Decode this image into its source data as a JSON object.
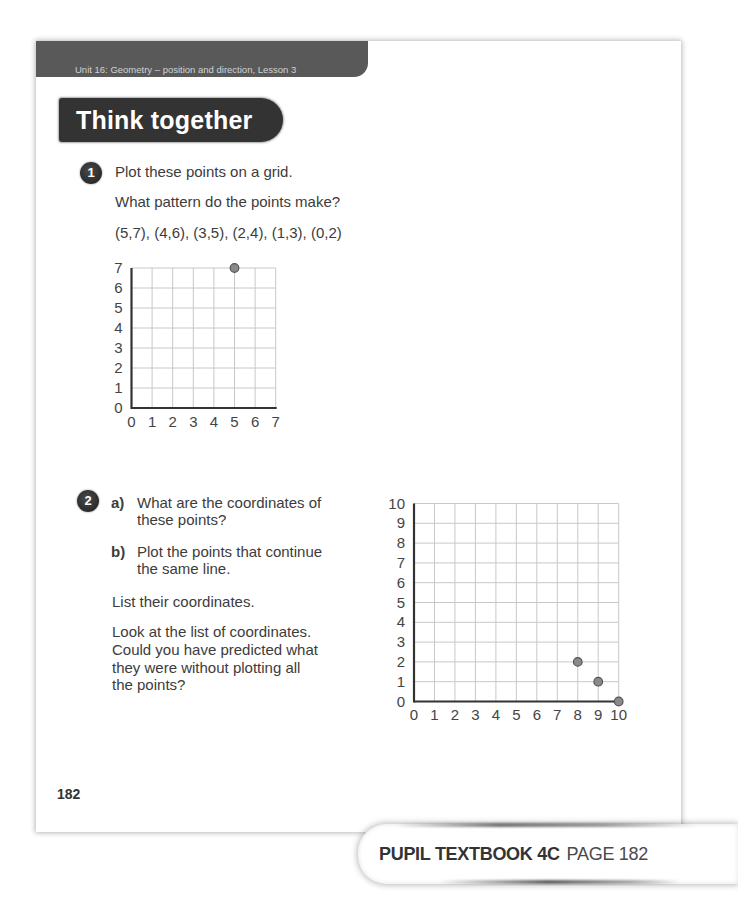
{
  "header": {
    "unit_label": "Unit 16: Geometry – position and direction, Lesson 3"
  },
  "banner": {
    "title": "Think together"
  },
  "questions": [
    {
      "number": "1",
      "lines": [
        "Plot these points on a grid.",
        "What pattern do the points make?",
        "(5,7), (4,6), (3,5), (2,4), (1,3), (0,2)"
      ]
    },
    {
      "number": "2",
      "parts": [
        {
          "label": "a)",
          "lines": [
            "What are the coordinates of",
            "these points?"
          ]
        },
        {
          "label": "b)",
          "lines": [
            "Plot the points that continue",
            "the same line."
          ]
        }
      ],
      "follow_up": "List their coordinates.",
      "reflection": [
        "Look at the list of coordinates.",
        "Could you have predicted what",
        "they were without plotting all",
        "the points?"
      ]
    }
  ],
  "page_number": "182",
  "footer": {
    "book": "PUPIL TEXTBOOK 4C",
    "page": "PAGE 182"
  },
  "colors": {
    "header_band": "#595959",
    "banner": "#333333",
    "grid_line": "#c8c8c8",
    "axis": "#333333",
    "point_fill": "#8a8a8a",
    "point_stroke": "#555555",
    "tick_label": "#444444"
  },
  "chart_data": [
    {
      "type": "scatter",
      "title": "",
      "xlabel": "",
      "ylabel": "",
      "xlim": [
        0,
        7
      ],
      "ylim": [
        0,
        7
      ],
      "x_ticks": [
        "0",
        "1",
        "2",
        "3",
        "4",
        "5",
        "6",
        "7"
      ],
      "y_ticks": [
        "0",
        "1",
        "2",
        "3",
        "4",
        "5",
        "6",
        "7"
      ],
      "grid": true,
      "points": [
        [
          5,
          7
        ]
      ]
    },
    {
      "type": "scatter",
      "title": "",
      "xlabel": "",
      "ylabel": "",
      "xlim": [
        0,
        10
      ],
      "ylim": [
        0,
        10
      ],
      "x_ticks": [
        "0",
        "1",
        "2",
        "3",
        "4",
        "5",
        "6",
        "7",
        "8",
        "9",
        "10"
      ],
      "y_ticks": [
        "0",
        "1",
        "2",
        "3",
        "4",
        "5",
        "6",
        "7",
        "8",
        "9",
        "10"
      ],
      "grid": true,
      "points": [
        [
          8,
          2
        ],
        [
          9,
          1
        ],
        [
          10,
          0
        ]
      ]
    }
  ]
}
